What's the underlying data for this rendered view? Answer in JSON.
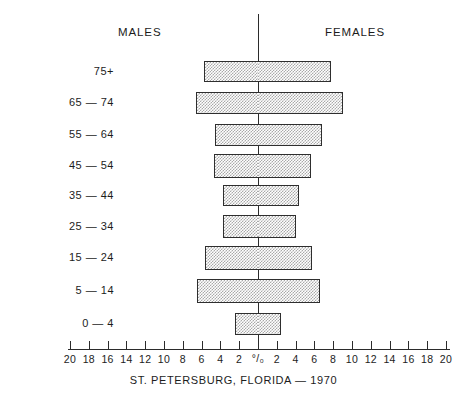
{
  "chart_data": {
    "type": "bar",
    "subtype": "population-pyramid",
    "title": "",
    "caption": "ST. PETERSBURG, FLORIDA — 1970",
    "xlabel": "",
    "ylabel": "",
    "unit_symbol": "°/₀",
    "grid": false,
    "legend_position": "top",
    "axis_labels": {
      "left_group": "MALES",
      "right_group": "FEMALES"
    },
    "xlim": [
      -20,
      20
    ],
    "xtick_values": [
      -20,
      -18,
      -16,
      -14,
      -12,
      -10,
      -8,
      -6,
      -4,
      -2,
      0,
      2,
      4,
      6,
      8,
      10,
      12,
      14,
      16,
      18,
      20
    ],
    "xtick_labels": [
      "20",
      "18",
      "16",
      "14",
      "12",
      "10",
      "8",
      "6",
      "4",
      "2",
      "°/₀",
      "2",
      "4",
      "6",
      "8",
      "10",
      "12",
      "14",
      "16",
      "18",
      "20"
    ],
    "categories": [
      "75+",
      "65 — 74",
      "55 — 64",
      "45 — 54",
      "35 — 44",
      "25 — 34",
      "15 — 24",
      "5 — 14",
      "0 — 4"
    ],
    "series": [
      {
        "name": "MALES",
        "side": "left",
        "values": [
          5.7,
          6.6,
          4.6,
          4.7,
          3.7,
          3.7,
          5.6,
          6.5,
          2.5
        ]
      },
      {
        "name": "FEMALES",
        "side": "right",
        "values": [
          7.8,
          9.0,
          6.8,
          5.6,
          4.4,
          4.0,
          5.7,
          6.6,
          2.4
        ]
      }
    ]
  },
  "figure": {
    "accent_color": "#2e2e2e",
    "bar_fill_color": "#a9a9a9",
    "background_color": "#ffffff"
  }
}
